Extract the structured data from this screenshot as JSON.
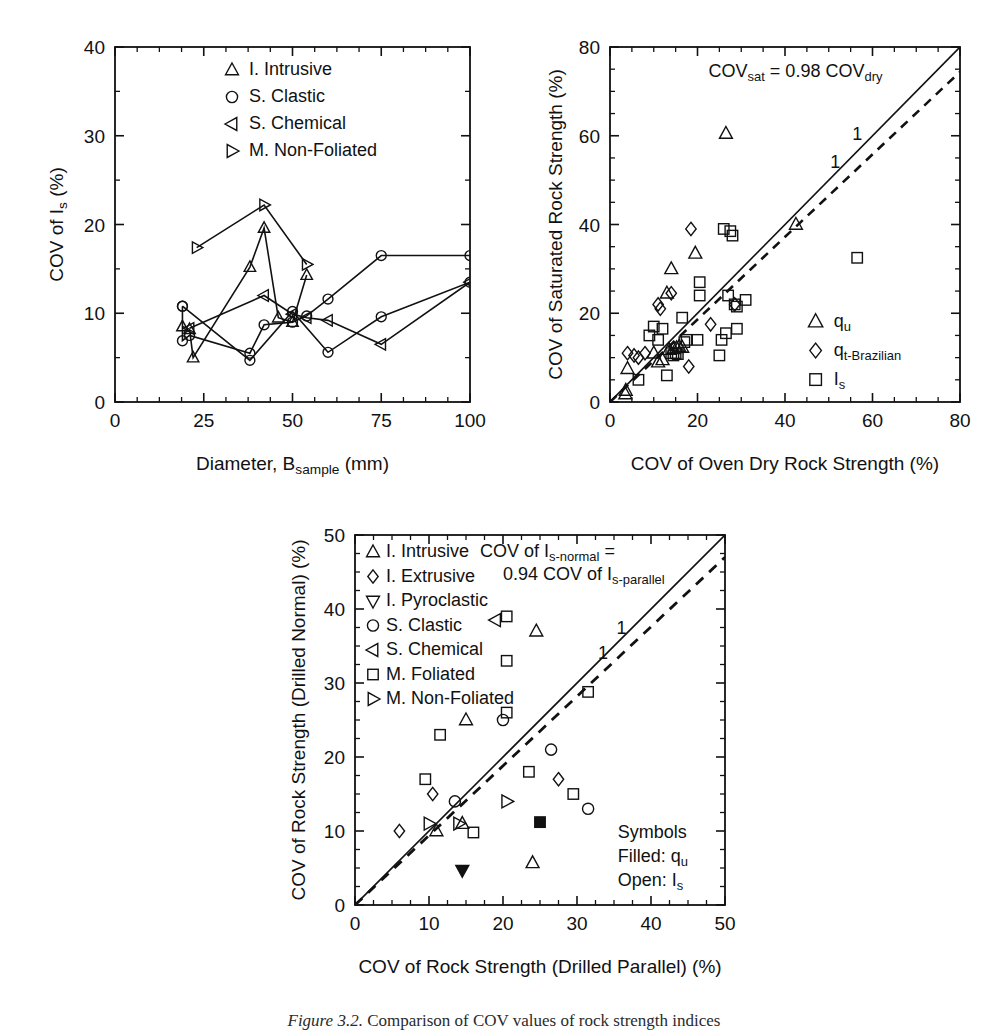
{
  "figure": {
    "caption_prefix": "Figure 3.2.",
    "caption_text": "Comparison of COV values of rock strength indices"
  },
  "panel_a": {
    "name": "COV of Is vs Diameter",
    "xlabel_main": "Diameter, B",
    "xlabel_sub": "sample",
    "xlabel_tail": " (mm)",
    "ylabel_main": "COV of I",
    "ylabel_sub": "s",
    "ylabel_tail": " (%)",
    "xticks": [
      "0",
      "25",
      "50",
      "75",
      "100"
    ],
    "yticks": [
      "0",
      "10",
      "20",
      "30",
      "40"
    ],
    "legend": [
      {
        "marker": "triangle-up",
        "label": "I. Intrusive"
      },
      {
        "marker": "circle",
        "label": "S. Clastic"
      },
      {
        "marker": "triangle-left",
        "label": "S. Chemical"
      },
      {
        "marker": "triangle-right",
        "label": "M. Non-Foliated"
      }
    ],
    "chart_data": {
      "type": "line",
      "title": "",
      "xlabel": "Diameter, B_sample (mm)",
      "ylabel": "COV of I_s (%)",
      "xlim": [
        0,
        100
      ],
      "ylim": [
        0,
        40
      ],
      "grid": false,
      "legend_position": "top-right",
      "series": [
        {
          "name": "I. Intrusive",
          "marker": "triangle-up",
          "points": [
            [
              19,
              8.5
            ],
            [
              21,
              8.2
            ],
            [
              22,
              5.0
            ],
            [
              38,
              15.2
            ],
            [
              42,
              19.6
            ],
            [
              46,
              9.5
            ],
            [
              50,
              9.0
            ],
            [
              54,
              14.3
            ]
          ]
        },
        {
          "name": "S. Clastic",
          "marker": "circle",
          "points": [
            [
              19,
              10.8
            ],
            [
              19,
              6.9
            ],
            [
              21,
              7.5
            ],
            [
              38,
              5.5
            ],
            [
              42,
              8.7
            ],
            [
              50,
              9.0
            ],
            [
              54,
              9.7
            ],
            [
              60,
              11.6
            ],
            [
              75,
              16.5
            ],
            [
              100,
              16.5
            ]
          ]
        },
        {
          "name": "S. Clastic-2",
          "marker": "circle",
          "points": [
            [
              19,
              10.8
            ],
            [
              38,
              4.7
            ],
            [
              50,
              10.2
            ],
            [
              60,
              5.6
            ],
            [
              75,
              9.6
            ],
            [
              100,
              13.5
            ]
          ]
        },
        {
          "name": "S. Chemical",
          "marker": "triangle-left",
          "points": [
            [
              21,
              8.3
            ],
            [
              42,
              12.0
            ],
            [
              50,
              9.9
            ],
            [
              54,
              9.5
            ],
            [
              60,
              9.2
            ],
            [
              75,
              6.5
            ],
            [
              100,
              13.5
            ]
          ]
        },
        {
          "name": "M. Non-Foliated",
          "marker": "triangle-right",
          "points": [
            [
              23,
              17.4
            ],
            [
              42,
              22.2
            ],
            [
              54,
              15.5
            ]
          ]
        }
      ]
    }
  },
  "panel_b": {
    "name": "COV of Saturated vs Oven Dry Rock Strength",
    "xlabel": "COV of Oven Dry Rock Strength (%)",
    "ylabel": "COV of Saturated Rock Strength (%)",
    "xticks": [
      "0",
      "20",
      "40",
      "60",
      "80"
    ],
    "yticks": [
      "0",
      "20",
      "40",
      "60",
      "80"
    ],
    "equation_main": "COV",
    "equation_sub1": "sat",
    "equation_mid": " = 0.98 COV",
    "equation_sub2": "dry",
    "slope_label_upper": "1",
    "slope_label_lower": "1",
    "legend": [
      {
        "marker": "triangle-up",
        "label": "q",
        "sub": "u"
      },
      {
        "marker": "diamond",
        "label": "q",
        "sub": "t-Brazilian"
      },
      {
        "marker": "square",
        "label": "I",
        "sub": "s"
      }
    ],
    "chart_data": {
      "type": "scatter",
      "title": "",
      "xlabel": "COV of Oven Dry Rock Strength (%)",
      "ylabel": "COV of Saturated Rock Strength (%)",
      "xlim": [
        0,
        80
      ],
      "ylim": [
        0,
        80
      ],
      "grid": false,
      "legend_position": "bottom-right",
      "reference_lines": [
        {
          "name": "1:1 line",
          "style": "solid",
          "slope": 1,
          "intercept": 0
        },
        {
          "name": "COV_sat = 0.98 COV_dry",
          "style": "dashed",
          "slope": 0.93,
          "intercept": 0
        }
      ],
      "series": [
        {
          "name": "q_u",
          "marker": "triangle-up",
          "points": [
            [
              3.5,
              1.8
            ],
            [
              3.6,
              2.6
            ],
            [
              4.0,
              7.5
            ],
            [
              10.0,
              11.0
            ],
            [
              11.0,
              9.0
            ],
            [
              12.0,
              9.5
            ],
            [
              13.5,
              11.8
            ],
            [
              14.5,
              12.0
            ],
            [
              15.2,
              12.2
            ],
            [
              15.8,
              12.5
            ],
            [
              16.5,
              12.3
            ],
            [
              13.0,
              24.5
            ],
            [
              14.0,
              30.0
            ],
            [
              19.5,
              33.5
            ],
            [
              26.5,
              60.5
            ],
            [
              42.5,
              40.0
            ]
          ]
        },
        {
          "name": "q_t-Brazilian",
          "marker": "diamond",
          "points": [
            [
              4.0,
              11.0
            ],
            [
              5.5,
              10.5
            ],
            [
              6.5,
              10.0
            ],
            [
              8.0,
              11.0
            ],
            [
              11.0,
              22.0
            ],
            [
              11.5,
              21.0
            ],
            [
              14.0,
              24.5
            ],
            [
              18.5,
              39.0
            ],
            [
              18.0,
              8.0
            ],
            [
              23.0,
              17.5
            ],
            [
              28.5,
              22.0
            ]
          ]
        },
        {
          "name": "I_s",
          "marker": "square",
          "points": [
            [
              6.5,
              5.0
            ],
            [
              9.0,
              15.0
            ],
            [
              10.0,
              17.0
            ],
            [
              11.0,
              14.0
            ],
            [
              13.0,
              6.0
            ],
            [
              14.0,
              11.0
            ],
            [
              14.5,
              10.5
            ],
            [
              15.0,
              11.0
            ],
            [
              15.5,
              10.8
            ],
            [
              16.5,
              19.0
            ],
            [
              17.0,
              13.5
            ],
            [
              17.5,
              14.0
            ],
            [
              20.0,
              14.0
            ],
            [
              20.5,
              27.0
            ],
            [
              20.5,
              24.0
            ],
            [
              26.0,
              39.0
            ],
            [
              27.5,
              38.5
            ],
            [
              28.0,
              37.5
            ],
            [
              27.0,
              24.0
            ],
            [
              28.5,
              22.0
            ],
            [
              29.0,
              21.5
            ],
            [
              31.0,
              23.0
            ],
            [
              26.5,
              15.5
            ],
            [
              29.0,
              16.5
            ],
            [
              25.5,
              14.0
            ],
            [
              25.0,
              10.5
            ],
            [
              56.5,
              32.5
            ],
            [
              12.0,
              16.5
            ]
          ]
        }
      ]
    }
  },
  "panel_c": {
    "name": "COV of Rock Strength Drilled Normal vs Parallel",
    "xlabel": "COV of Rock Strength (Drilled Parallel) (%)",
    "ylabel_main": "COV of Rock Strength (Drilled Normal) (%)",
    "xticks": [
      "0",
      "10",
      "20",
      "30",
      "40",
      "50"
    ],
    "yticks": [
      "0",
      "10",
      "20",
      "30",
      "40",
      "50"
    ],
    "equation_line1_main": "COV of I",
    "equation_line1_sub": "s-normal",
    "equation_line1_tail": " =",
    "equation_line2_main": "0.94 COV of I",
    "equation_line2_sub": "s-parallel",
    "slope_label_upper": "1",
    "slope_label_lower": "1",
    "legend": [
      {
        "marker": "triangle-up",
        "label": "I. Intrusive"
      },
      {
        "marker": "diamond",
        "label": "I. Extrusive"
      },
      {
        "marker": "triangle-down",
        "label": "I. Pyroclastic"
      },
      {
        "marker": "circle",
        "label": "S. Clastic"
      },
      {
        "marker": "triangle-left",
        "label": "S. Chemical"
      },
      {
        "marker": "square",
        "label": "M. Foliated"
      },
      {
        "marker": "triangle-right",
        "label": "M. Non-Foliated"
      }
    ],
    "symbols_note": {
      "title": "Symbols",
      "filled_label": "Filled: q",
      "filled_sub": "u",
      "open_label": "Open: I",
      "open_sub": "s"
    },
    "chart_data": {
      "type": "scatter",
      "title": "",
      "xlabel": "COV of Rock Strength (Drilled Parallel) (%)",
      "ylabel": "COV of Rock Strength (Drilled Normal) (%)",
      "xlim": [
        0,
        50
      ],
      "ylim": [
        0,
        50
      ],
      "grid": false,
      "legend_position": "top-left",
      "reference_lines": [
        {
          "name": "1:1 line",
          "style": "solid",
          "slope": 1,
          "intercept": 0
        },
        {
          "name": "COV Is-normal = 0.94 COV Is-parallel",
          "style": "dashed",
          "slope": 0.94,
          "intercept": 0
        }
      ],
      "series": [
        {
          "name": "I. Intrusive",
          "marker": "triangle-up",
          "fill": "open",
          "points": [
            [
              11.0,
              10.0
            ],
            [
              14.5,
              11.0
            ],
            [
              15.0,
              25.0
            ],
            [
              24.5,
              37.0
            ],
            [
              24.0,
              5.7
            ]
          ]
        },
        {
          "name": "I. Extrusive",
          "marker": "diamond",
          "fill": "open",
          "points": [
            [
              6.0,
              10.0
            ],
            [
              10.5,
              15.0
            ],
            [
              27.5,
              17.0
            ]
          ]
        },
        {
          "name": "I. Pyroclastic",
          "marker": "triangle-down",
          "fill": "filled",
          "points": [
            [
              14.5,
              4.7
            ]
          ]
        },
        {
          "name": "S. Clastic",
          "marker": "circle",
          "fill": "open",
          "points": [
            [
              13.5,
              14.0
            ],
            [
              20.0,
              25.0
            ],
            [
              26.5,
              21.0
            ],
            [
              31.5,
              13.0
            ]
          ]
        },
        {
          "name": "S. Chemical",
          "marker": "triangle-left",
          "fill": "open",
          "points": [
            [
              19.0,
              38.5
            ]
          ]
        },
        {
          "name": "M. Foliated",
          "marker": "square",
          "fill": "open",
          "points": [
            [
              9.5,
              17.0
            ],
            [
              11.5,
              23.0
            ],
            [
              16.0,
              9.8
            ],
            [
              20.5,
              39.0
            ],
            [
              20.5,
              33.0
            ],
            [
              20.5,
              26.0
            ],
            [
              23.5,
              18.0
            ],
            [
              29.5,
              15.0
            ],
            [
              31.5,
              28.8
            ]
          ]
        },
        {
          "name": "M. Foliated (filled q_u)",
          "marker": "square",
          "fill": "filled",
          "points": [
            [
              25.0,
              11.2
            ]
          ]
        },
        {
          "name": "M. Non-Foliated",
          "marker": "triangle-right",
          "fill": "open",
          "points": [
            [
              10.0,
              11.0
            ],
            [
              14.0,
              11.0
            ],
            [
              20.5,
              14.0
            ]
          ]
        }
      ]
    }
  }
}
